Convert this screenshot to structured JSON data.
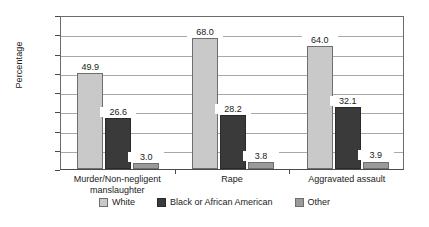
{
  "chart_data": {
    "type": "bar",
    "title": "",
    "subtitle": "",
    "xlabel": "",
    "ylabel": "Percentage",
    "ylim": [
      0,
      80
    ],
    "ytick_labels": [
      "80.0",
      "70.0",
      "60.0",
      "50.0",
      "40.0",
      "30.0",
      "20.0",
      "10.0",
      "0.0"
    ],
    "ytick_values": [
      80,
      70,
      60,
      50,
      40,
      30,
      20,
      10,
      0
    ],
    "grid": true,
    "legend_position": "bottom",
    "categories": [
      "Murder/Non-negligent manslaughter",
      "Rape",
      "Aggravated assault"
    ],
    "category_lines": [
      [
        "Murder/Non-negligent",
        "manslaughter"
      ],
      [
        "Rape"
      ],
      [
        "Aggravated assault"
      ]
    ],
    "series": [
      {
        "name": "White",
        "color": "#c9c9c9",
        "values": [
          49.9,
          68.0,
          64.0
        ],
        "labels": [
          "49.9",
          "68.0",
          "64.0"
        ]
      },
      {
        "name": "Black or African American",
        "color": "#3a3a3a",
        "values": [
          26.6,
          28.2,
          32.1
        ],
        "labels": [
          "26.6",
          "28.2",
          "32.1"
        ]
      },
      {
        "name": "Other",
        "color": "#9a9a9a",
        "values": [
          3.0,
          3.8,
          3.9
        ],
        "labels": [
          "3.0",
          "3.8",
          "3.9"
        ]
      }
    ]
  }
}
